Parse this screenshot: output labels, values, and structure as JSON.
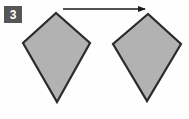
{
  "figure": {
    "step_label": "3",
    "background_color": "#fefefe",
    "shape_fill_color": "#b2b2b2",
    "shape_stroke_color": "#2b2b2b",
    "arrow_color": "#1a1a1a",
    "badge_background_color": "#555555",
    "badge_text_color": "#ffffff",
    "caption": "",
    "shapes": [
      {
        "name": "kite-left",
        "label": "",
        "points": "56,13 23,43 57,102 90,43",
        "fill": "#b2b2b2",
        "stroke": "#2b2b2b",
        "stroke_width": 2.2
      },
      {
        "name": "kite-right",
        "label": "",
        "points": "148,14 113,44 147,101 181,44",
        "fill": "#b2b2b2",
        "stroke": "#2b2b2b",
        "stroke_width": 2.2
      }
    ],
    "arrow": {
      "name": "transform-arrow",
      "label": "",
      "x1": 63,
      "y1": 9,
      "x2": 145,
      "y2": 9,
      "head_points": "146,9 138,6 138,12",
      "color": "#1a1a1a",
      "stroke_width": 1.6
    }
  }
}
